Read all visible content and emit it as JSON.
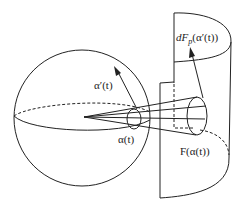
{
  "diagram": {
    "type": "differential geometry illustration",
    "shapes": {
      "sphere": "sphere with equator (front solid, back dashed)",
      "surface": "curved cylindrical surface patch",
      "cone": "projection cone from sphere center through small circle"
    },
    "labels": {
      "alpha_prime": "α′(t)",
      "alpha": "α(t)",
      "dF": "dF",
      "dF_sub": "p",
      "dF_arg": "(α′(t))",
      "F_alpha": "F(α(t))"
    },
    "colors": {
      "stroke": "#222222",
      "background": "#ffffff"
    }
  }
}
